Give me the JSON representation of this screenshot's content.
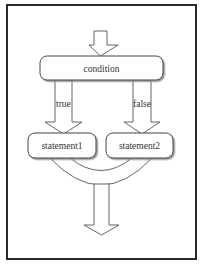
{
  "diagram": {
    "type": "flowchart-if-else",
    "colors": {
      "frame": "#2a2a2a",
      "stroke": "#555555",
      "box_fill": "#ffffff",
      "shadow": "#8a8a8a",
      "text": "#333333",
      "background": "#ffffff"
    },
    "nodes": {
      "condition": {
        "label": "condition"
      },
      "statement1": {
        "label": "statement1"
      },
      "statement2": {
        "label": "statement2"
      }
    },
    "edges": {
      "entry": {
        "label": ""
      },
      "true_branch": {
        "label": "true"
      },
      "false_branch": {
        "label": "false"
      },
      "exit": {
        "label": ""
      }
    }
  }
}
